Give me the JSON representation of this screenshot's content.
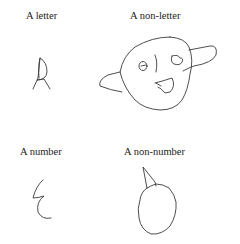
{
  "panels": [
    {
      "label": "A letter",
      "drawing": "handwritten-letter-A"
    },
    {
      "label": "A non-letter",
      "drawing": "face-blob-with-arms"
    },
    {
      "label": "A number",
      "drawing": "handwritten-number-3-reversed"
    },
    {
      "label": "A non-number",
      "drawing": "oval-with-spike"
    }
  ],
  "colors": {
    "background": "#ffffff",
    "ink": "#3a3a3a",
    "text": "#222222"
  }
}
